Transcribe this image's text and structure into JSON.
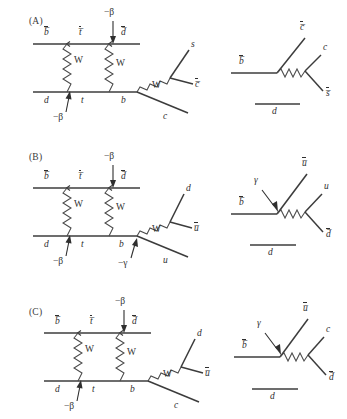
{
  "figure": {
    "type": "feynman-diagrams",
    "background": "#ffffff",
    "line_color": "#3c3c3c",
    "panel_count": 3
  },
  "panels": [
    {
      "id": "A",
      "label": "(A)",
      "box_diagram": {
        "top_line_labels": [
          "b̅",
          "t̅",
          "d̅"
        ],
        "bottom_line_labels": [
          "d",
          "t",
          "b"
        ],
        "boson_labels": [
          "W",
          "W"
        ],
        "phase_labels": [
          "−β",
          "−β"
        ],
        "decay_boson_label": "W",
        "decay_products": [
          "s",
          "c̅",
          "c"
        ]
      },
      "effective_diagram": {
        "in_label": "b̅",
        "out_labels": [
          "c̅",
          "c",
          "s̅"
        ],
        "spectator_label": "d",
        "photon_label": ""
      }
    },
    {
      "id": "B",
      "label": "(B)",
      "box_diagram": {
        "top_line_labels": [
          "b̅",
          "t̅",
          "d̅"
        ],
        "bottom_line_labels": [
          "d",
          "t",
          "b"
        ],
        "boson_labels": [
          "W",
          "W"
        ],
        "phase_labels": [
          "−β",
          "−β",
          "−γ"
        ],
        "decay_boson_label": "W",
        "decay_products": [
          "d",
          "u̅",
          "u"
        ]
      },
      "effective_diagram": {
        "in_label": "b̅",
        "out_labels": [
          "u̅",
          "u",
          "d̅"
        ],
        "spectator_label": "d",
        "photon_label": "γ"
      }
    },
    {
      "id": "C",
      "label": "(C)",
      "box_diagram": {
        "top_line_labels": [
          "b̅",
          "t̅",
          "d̅"
        ],
        "bottom_line_labels": [
          "d",
          "t",
          "b"
        ],
        "boson_labels": [
          "W",
          "W"
        ],
        "phase_labels": [
          "−β",
          "−β"
        ],
        "decay_boson_label": "W",
        "decay_products": [
          "d",
          "u̅",
          "c"
        ]
      },
      "effective_diagram": {
        "in_label": "b̅",
        "out_labels": [
          "u̅",
          "c",
          "d̅"
        ],
        "spectator_label": "d",
        "photon_label": "γ"
      }
    }
  ]
}
